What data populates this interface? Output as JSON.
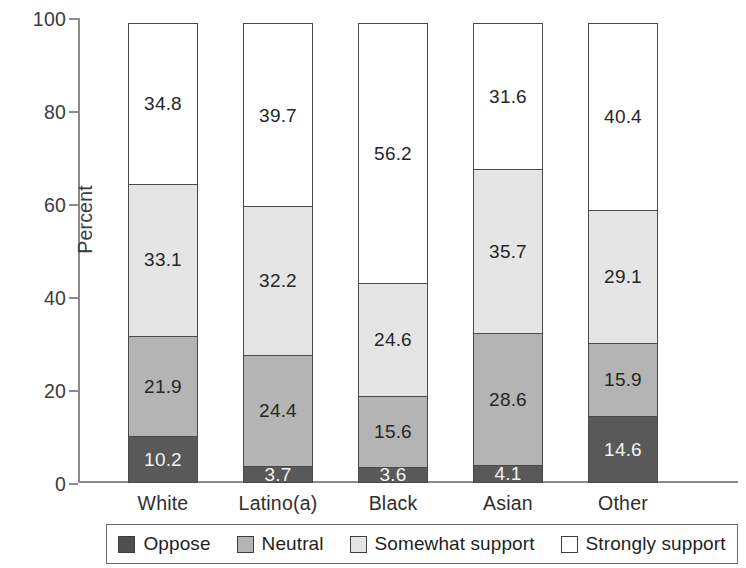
{
  "chart_data": {
    "type": "bar",
    "subtype": "stacked-bar-100",
    "title": "",
    "xlabel": "",
    "ylabel": "Percent",
    "ylim": [
      0,
      100
    ],
    "yticks": [
      0,
      20,
      40,
      60,
      80,
      100
    ],
    "grid": false,
    "legend_position": "bottom",
    "categories": [
      "White",
      "Latino(a)",
      "Black",
      "Asian",
      "Other"
    ],
    "series": [
      {
        "name": "Oppose",
        "color": "#595959",
        "values": [
          10.2,
          3.7,
          3.6,
          4.1,
          14.6
        ]
      },
      {
        "name": "Neutral",
        "color": "#b4b4b4",
        "values": [
          21.9,
          24.4,
          15.6,
          28.6,
          15.9
        ]
      },
      {
        "name": "Somewhat support",
        "color": "#e5e5e5",
        "values": [
          33.1,
          32.2,
          24.6,
          35.7,
          29.1
        ]
      },
      {
        "name": "Strongly support",
        "color": "#ffffff",
        "values": [
          34.8,
          39.7,
          56.2,
          31.6,
          40.4
        ]
      }
    ],
    "value_labels": {
      "White": [
        "10.2",
        "21.9",
        "33.1",
        "34.8"
      ],
      "Latino(a)": [
        "3.7",
        "24.4",
        "32.2",
        "39.7"
      ],
      "Black": [
        "3.6",
        "15.6",
        "24.6",
        "56.2"
      ],
      "Asian": [
        "4.1",
        "28.6",
        "35.7",
        "31.6"
      ],
      "Other": [
        "14.6",
        "15.9",
        "29.1",
        "40.4"
      ]
    }
  },
  "axis": {
    "y_title": "Percent",
    "y_ticks": [
      "0",
      "20",
      "40",
      "60",
      "80",
      "100"
    ]
  },
  "legend": {
    "items": [
      {
        "label": "Oppose"
      },
      {
        "label": "Neutral"
      },
      {
        "label": "Somewhat support"
      },
      {
        "label": "Strongly support"
      }
    ]
  }
}
